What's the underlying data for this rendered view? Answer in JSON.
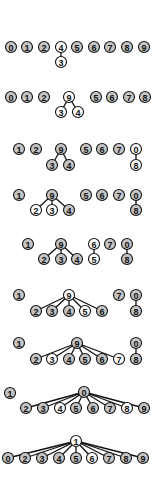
{
  "diagram": {
    "title": "",
    "colors": {
      "default_fill": "#c4c4c4",
      "highlight_fill": "#ffffff",
      "stroke": "#111111",
      "background": "#ffffff"
    },
    "node_radius": 5.5,
    "steps": [
      {
        "nodes": [
          {
            "label": "0",
            "x": 11,
            "y": 47,
            "hl": false
          },
          {
            "label": "1",
            "x": 27,
            "y": 47,
            "hl": false
          },
          {
            "label": "2",
            "x": 44,
            "y": 47,
            "hl": false
          },
          {
            "label": "4",
            "x": 61,
            "y": 47,
            "hl": true
          },
          {
            "label": "3",
            "x": 61,
            "y": 62,
            "hl": true
          },
          {
            "label": "5",
            "x": 77,
            "y": 47,
            "hl": false
          },
          {
            "label": "6",
            "x": 94,
            "y": 47,
            "hl": false
          },
          {
            "label": "7",
            "x": 110,
            "y": 47,
            "hl": false
          },
          {
            "label": "8",
            "x": 127,
            "y": 47,
            "hl": false
          },
          {
            "label": "9",
            "x": 144,
            "y": 47,
            "hl": false
          }
        ],
        "edges": [
          [
            "4",
            "3"
          ]
        ]
      },
      {
        "nodes": [
          {
            "label": "0",
            "x": 11,
            "y": 97,
            "hl": false
          },
          {
            "label": "1",
            "x": 27,
            "y": 97,
            "hl": false
          },
          {
            "label": "2",
            "x": 44,
            "y": 97,
            "hl": false
          },
          {
            "label": "9",
            "x": 69,
            "y": 97,
            "hl": true
          },
          {
            "label": "3",
            "x": 61,
            "y": 112,
            "hl": true
          },
          {
            "label": "4",
            "x": 78,
            "y": 112,
            "hl": true
          },
          {
            "label": "5",
            "x": 96,
            "y": 97,
            "hl": false
          },
          {
            "label": "6",
            "x": 112,
            "y": 97,
            "hl": false
          },
          {
            "label": "7",
            "x": 129,
            "y": 97,
            "hl": false
          },
          {
            "label": "8",
            "x": 145,
            "y": 97,
            "hl": false
          }
        ],
        "edges": [
          [
            "9",
            "3"
          ],
          [
            "9",
            "4"
          ]
        ]
      },
      {
        "nodes": [
          {
            "label": "1",
            "x": 19,
            "y": 149,
            "hl": false
          },
          {
            "label": "2",
            "x": 36,
            "y": 149,
            "hl": false
          },
          {
            "label": "9",
            "x": 61,
            "y": 149,
            "hl": false
          },
          {
            "label": "3",
            "x": 52,
            "y": 165,
            "hl": false
          },
          {
            "label": "4",
            "x": 69,
            "y": 165,
            "hl": false
          },
          {
            "label": "5",
            "x": 86,
            "y": 149,
            "hl": false
          },
          {
            "label": "6",
            "x": 102,
            "y": 149,
            "hl": false
          },
          {
            "label": "7",
            "x": 119,
            "y": 149,
            "hl": false
          },
          {
            "label": "0",
            "x": 136,
            "y": 149,
            "hl": true
          },
          {
            "label": "8",
            "x": 136,
            "y": 165,
            "hl": true
          }
        ],
        "edges": [
          [
            "9",
            "3"
          ],
          [
            "9",
            "4"
          ],
          [
            "0",
            "8"
          ]
        ]
      },
      {
        "nodes": [
          {
            "label": "1",
            "x": 19,
            "y": 195,
            "hl": false
          },
          {
            "label": "9",
            "x": 52,
            "y": 195,
            "hl": false
          },
          {
            "label": "2",
            "x": 36,
            "y": 210,
            "hl": true
          },
          {
            "label": "3",
            "x": 52,
            "y": 210,
            "hl": true
          },
          {
            "label": "4",
            "x": 69,
            "y": 210,
            "hl": false
          },
          {
            "label": "5",
            "x": 86,
            "y": 195,
            "hl": false
          },
          {
            "label": "6",
            "x": 102,
            "y": 195,
            "hl": false
          },
          {
            "label": "7",
            "x": 119,
            "y": 195,
            "hl": false
          },
          {
            "label": "0",
            "x": 136,
            "y": 195,
            "hl": false
          },
          {
            "label": "8",
            "x": 136,
            "y": 210,
            "hl": false
          }
        ],
        "edges": [
          [
            "9",
            "2"
          ],
          [
            "9",
            "3"
          ],
          [
            "9",
            "4"
          ],
          [
            "0",
            "8"
          ]
        ]
      },
      {
        "nodes": [
          {
            "label": "1",
            "x": 28,
            "y": 244,
            "hl": false
          },
          {
            "label": "9",
            "x": 61,
            "y": 244,
            "hl": false
          },
          {
            "label": "2",
            "x": 44,
            "y": 259,
            "hl": false
          },
          {
            "label": "3",
            "x": 61,
            "y": 259,
            "hl": false
          },
          {
            "label": "4",
            "x": 77,
            "y": 259,
            "hl": false
          },
          {
            "label": "6",
            "x": 94,
            "y": 244,
            "hl": true
          },
          {
            "label": "5",
            "x": 94,
            "y": 259,
            "hl": true
          },
          {
            "label": "7",
            "x": 110,
            "y": 244,
            "hl": false
          },
          {
            "label": "0",
            "x": 127,
            "y": 244,
            "hl": false
          },
          {
            "label": "8",
            "x": 127,
            "y": 259,
            "hl": false
          }
        ],
        "edges": [
          [
            "9",
            "2"
          ],
          [
            "9",
            "3"
          ],
          [
            "9",
            "4"
          ],
          [
            "6",
            "5"
          ],
          [
            "0",
            "8"
          ]
        ]
      },
      {
        "nodes": [
          {
            "label": "1",
            "x": 19,
            "y": 295,
            "hl": false
          },
          {
            "label": "9",
            "x": 69,
            "y": 295,
            "hl": true
          },
          {
            "label": "2",
            "x": 36,
            "y": 311,
            "hl": false
          },
          {
            "label": "3",
            "x": 52,
            "y": 311,
            "hl": false
          },
          {
            "label": "4",
            "x": 69,
            "y": 311,
            "hl": false
          },
          {
            "label": "5",
            "x": 85,
            "y": 311,
            "hl": true
          },
          {
            "label": "6",
            "x": 102,
            "y": 311,
            "hl": false
          },
          {
            "label": "7",
            "x": 119,
            "y": 295,
            "hl": false
          },
          {
            "label": "0",
            "x": 136,
            "y": 295,
            "hl": false
          },
          {
            "label": "8",
            "x": 136,
            "y": 311,
            "hl": false
          }
        ],
        "edges": [
          [
            "9",
            "2"
          ],
          [
            "9",
            "3"
          ],
          [
            "9",
            "4"
          ],
          [
            "9",
            "5"
          ],
          [
            "9",
            "6"
          ],
          [
            "0",
            "8"
          ]
        ]
      },
      {
        "nodes": [
          {
            "label": "1",
            "x": 19,
            "y": 343,
            "hl": false
          },
          {
            "label": "9",
            "x": 77,
            "y": 343,
            "hl": false
          },
          {
            "label": "2",
            "x": 36,
            "y": 359,
            "hl": false
          },
          {
            "label": "3",
            "x": 52,
            "y": 359,
            "hl": true
          },
          {
            "label": "4",
            "x": 69,
            "y": 359,
            "hl": false
          },
          {
            "label": "5",
            "x": 85,
            "y": 359,
            "hl": false
          },
          {
            "label": "6",
            "x": 102,
            "y": 359,
            "hl": false
          },
          {
            "label": "7",
            "x": 119,
            "y": 359,
            "hl": true
          },
          {
            "label": "0",
            "x": 136,
            "y": 343,
            "hl": false
          },
          {
            "label": "8",
            "x": 136,
            "y": 359,
            "hl": false
          }
        ],
        "edges": [
          [
            "9",
            "2"
          ],
          [
            "9",
            "3"
          ],
          [
            "9",
            "4"
          ],
          [
            "9",
            "5"
          ],
          [
            "9",
            "6"
          ],
          [
            "9",
            "7"
          ],
          [
            "0",
            "8"
          ]
        ]
      },
      {
        "nodes": [
          {
            "label": "1",
            "x": 10,
            "y": 393,
            "hl": false
          },
          {
            "label": "0",
            "x": 84,
            "y": 392,
            "hl": false
          },
          {
            "label": "2",
            "x": 26,
            "y": 408,
            "hl": false
          },
          {
            "label": "3",
            "x": 43,
            "y": 408,
            "hl": false
          },
          {
            "label": "4",
            "x": 60,
            "y": 408,
            "hl": true
          },
          {
            "label": "5",
            "x": 76,
            "y": 408,
            "hl": false
          },
          {
            "label": "6",
            "x": 93,
            "y": 408,
            "hl": false
          },
          {
            "label": "7",
            "x": 110,
            "y": 408,
            "hl": false
          },
          {
            "label": "8",
            "x": 127,
            "y": 408,
            "hl": true
          },
          {
            "label": "9",
            "x": 144,
            "y": 408,
            "hl": false
          }
        ],
        "edges": [
          [
            "0",
            "2"
          ],
          [
            "0",
            "3"
          ],
          [
            "0",
            "4"
          ],
          [
            "0",
            "5"
          ],
          [
            "0",
            "6"
          ],
          [
            "0",
            "7"
          ],
          [
            "0",
            "8"
          ],
          [
            "0",
            "9"
          ]
        ]
      },
      {
        "nodes": [
          {
            "label": "1",
            "x": 76,
            "y": 441,
            "hl": true
          },
          {
            "label": "0",
            "x": 8,
            "y": 458,
            "hl": false
          },
          {
            "label": "2",
            "x": 25,
            "y": 458,
            "hl": false
          },
          {
            "label": "3",
            "x": 42,
            "y": 458,
            "hl": false
          },
          {
            "label": "4",
            "x": 59,
            "y": 458,
            "hl": false
          },
          {
            "label": "5",
            "x": 76,
            "y": 458,
            "hl": false
          },
          {
            "label": "6",
            "x": 92,
            "y": 458,
            "hl": true
          },
          {
            "label": "7",
            "x": 109,
            "y": 458,
            "hl": false
          },
          {
            "label": "8",
            "x": 126,
            "y": 458,
            "hl": false
          },
          {
            "label": "9",
            "x": 143,
            "y": 458,
            "hl": false
          }
        ],
        "edges": [
          [
            "1",
            "0"
          ],
          [
            "1",
            "2"
          ],
          [
            "1",
            "3"
          ],
          [
            "1",
            "4"
          ],
          [
            "1",
            "5"
          ],
          [
            "1",
            "6"
          ],
          [
            "1",
            "7"
          ],
          [
            "1",
            "8"
          ],
          [
            "1",
            "9"
          ]
        ]
      }
    ]
  }
}
